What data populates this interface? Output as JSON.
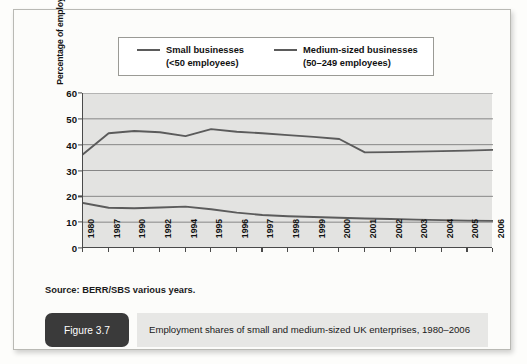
{
  "legend": {
    "series": [
      {
        "label_line1": "Small businesses",
        "label_line2": "(<50 employees)",
        "color": "#5b5b5b"
      },
      {
        "label_line1": "Medium-sized businesses",
        "label_line2": "(50–249 employees)",
        "color": "#5b5b5b"
      }
    ]
  },
  "source": {
    "text": "Source: BERR/SBS various years."
  },
  "caption": {
    "figure_number": "Figure 3.7",
    "title": "Employment shares of small and medium-sized UK enterprises, 1980–2006"
  },
  "chart_data": {
    "type": "line",
    "title": "Employment shares of small and medium-sized UK enterprises, 1980–2006",
    "xlabel": "",
    "ylabel": "Percentage of employment",
    "ylim": [
      0,
      60
    ],
    "yticks": [
      0,
      10,
      20,
      30,
      40,
      50,
      60
    ],
    "grid": true,
    "legend_position": "top",
    "categories": [
      "1980",
      "1987",
      "1990",
      "1992",
      "1994",
      "1995",
      "1996",
      "1997",
      "1998",
      "1999",
      "2000",
      "2001",
      "2002",
      "2003",
      "2004",
      "2005",
      "2006"
    ],
    "series": [
      {
        "name": "Small businesses (<50 employees)",
        "color": "#5b5b5b",
        "values": [
          36.3,
          44.4,
          45.3,
          44.8,
          43.3,
          46.0,
          45.0,
          44.4,
          43.7,
          43.0,
          42.2,
          37.0,
          37.1,
          37.3,
          37.5,
          37.7,
          38.0
        ]
      },
      {
        "name": "Medium-sized businesses (50–249 employees)",
        "color": "#5b5b5b",
        "values": [
          17.4,
          15.6,
          15.4,
          15.7,
          16.0,
          15.0,
          13.7,
          12.8,
          12.3,
          12.0,
          11.7,
          11.4,
          11.2,
          11.0,
          10.8,
          10.6,
          10.5
        ]
      }
    ]
  }
}
